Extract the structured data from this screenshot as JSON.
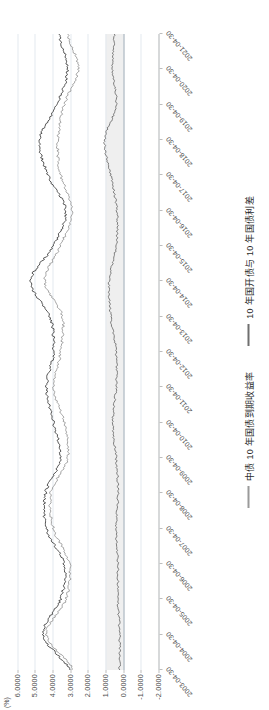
{
  "chart_data": {
    "type": "line",
    "title": "",
    "xlabel": "",
    "ylabel": "",
    "yunit": "(%)",
    "ylim": [
      -2.0,
      6.5
    ],
    "yticks": [
      "6.0000",
      "5.0000",
      "4.0000",
      "3.0000",
      "2.0000",
      "1.0000",
      "0.0000",
      "-1.0000",
      "-2.0000"
    ],
    "ytick_values": [
      6.0,
      5.0,
      4.0,
      3.0,
      2.0,
      1.0,
      0.0,
      -1.0,
      -2.0
    ],
    "grid": true,
    "legend_position": "bottom",
    "x": [
      "2003-04-30",
      "2004-04-30",
      "2005-04-30",
      "2006-04-30",
      "2007-04-30",
      "2008-04-30",
      "2009-04-30",
      "2010-04-30",
      "2011-04-30",
      "2012-04-30",
      "2013-04-30",
      "2014-04-30",
      "2015-04-30",
      "2016-04-30",
      "2017-04-30",
      "2018-04-30",
      "2019-04-30",
      "2020-04-30",
      "2021-04-30"
    ],
    "series": [
      {
        "name": "中债 10 年国开债到期收益率",
        "color": "#3f3f3f",
        "values": [
          3.05,
          4.55,
          3.55,
          3.35,
          4.35,
          4.4,
          3.55,
          3.95,
          4.35,
          3.95,
          4.15,
          5.25,
          3.95,
          3.25,
          4.25,
          4.75,
          3.75,
          3.15,
          3.65
        ]
      },
      {
        "name": "中债 10 年国债到期收益率",
        "color": "#9a9a9a",
        "values": [
          2.85,
          4.35,
          3.25,
          3.05,
          3.95,
          4.1,
          3.15,
          3.35,
          3.95,
          3.55,
          3.45,
          4.45,
          3.55,
          2.9,
          3.55,
          3.7,
          3.35,
          2.55,
          3.15
        ]
      },
      {
        "name": "10 年国开债与 10 年国债利差",
        "color": "#6f6f6f",
        "values": [
          0.2,
          0.2,
          0.3,
          0.3,
          0.4,
          0.3,
          0.4,
          0.6,
          0.4,
          0.4,
          0.7,
          0.8,
          0.4,
          0.35,
          0.7,
          1.05,
          0.4,
          0.6,
          0.5
        ]
      }
    ],
    "shaded_band": {
      "from": 0.0,
      "to": 1.0,
      "color": "#ececec"
    },
    "zero_reference": 0.0
  },
  "legend": {
    "items": [
      {
        "label": "中债 10 年国债到期收益率",
        "color": "#9a9a9a"
      },
      {
        "label": "10 年国开债与 10 年国债利差",
        "color": "#6f6f6f"
      }
    ]
  },
  "watermark": {
    "text": "中信证券研究部"
  }
}
